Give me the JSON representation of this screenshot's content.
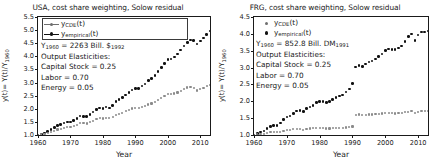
{
  "figure": {
    "panels": [
      {
        "id": "usa",
        "title": "USA, cost share weighting, Solow residual",
        "xlabel": "Year",
        "ylabel": "y(t)= Y(t)/Y",
        "ylabel_sub": "1960",
        "legend": [
          {
            "name": "y",
            "sub": "CDE",
            "suffix": "(t)",
            "color": "#8a8a8a",
            "style": "line-marker"
          },
          {
            "name": "y",
            "sub": "empirical",
            "suffix": "(t)",
            "color": "#101010",
            "style": "line-marker"
          }
        ],
        "annotations": [
          {
            "text": "Y",
            "sub": "1960",
            "rest": " = 2263 Bill. $",
            "sub2": "1992"
          },
          {
            "text": "Output Elasticities:"
          },
          {
            "text": "Capital Stock = 0.25"
          },
          {
            "text": "Labor = 0.70"
          },
          {
            "text": "Energy = 0.05"
          }
        ],
        "base_year_value": "2263",
        "currency": "Bill. $1992",
        "elasticities": {
          "capital_stock": "0.25",
          "labor": "0.70",
          "energy": "0.05"
        }
      },
      {
        "id": "frg",
        "title": "FRG, cost share weighting, Solow residual",
        "xlabel": "Year",
        "ylabel": "y(t)= Y(t)/Y",
        "ylabel_sub": "1960",
        "legend": [
          {
            "name": "y",
            "sub": "CDE",
            "suffix": "(t)",
            "color": "#8a8a8a",
            "style": "marker"
          },
          {
            "name": "y",
            "sub": "empirical",
            "suffix": "(t)",
            "color": "#101010",
            "style": "marker"
          }
        ],
        "annotations": [
          {
            "text": "Y",
            "sub": "1960",
            "rest": " = 852.8 Bill. DM",
            "sub2": "1991"
          },
          {
            "text": "Output Elasticities:"
          },
          {
            "text": "Capital Stock = 0.25"
          },
          {
            "text": "Labor = 0.70"
          },
          {
            "text": "Energy = 0.05"
          }
        ],
        "base_year_value": "852.8",
        "currency": "Bill. DM1991",
        "elasticities": {
          "capital_stock": "0.25",
          "labor": "0.70",
          "energy": "0.05"
        }
      }
    ]
  },
  "chart_data": [
    {
      "type": "scatter",
      "panel": "usa",
      "title": "USA, cost share weighting, Solow residual",
      "xlabel": "Year",
      "ylabel": "y(t)= Y(t)/Y_1960",
      "xlim": [
        1960,
        2013
      ],
      "ylim": [
        1.0,
        5.5
      ],
      "xticks": [
        1960,
        1970,
        1980,
        1990,
        2000,
        2010
      ],
      "yticks": [
        1.0,
        1.5,
        2.0,
        2.5,
        3.0,
        3.5,
        4.0,
        4.5,
        5.0,
        5.5
      ],
      "grid": false,
      "legend_position": "upper-left",
      "x": [
        1960,
        1961,
        1962,
        1963,
        1964,
        1965,
        1966,
        1967,
        1968,
        1969,
        1970,
        1971,
        1972,
        1973,
        1974,
        1975,
        1976,
        1977,
        1978,
        1979,
        1980,
        1981,
        1982,
        1983,
        1984,
        1985,
        1986,
        1987,
        1988,
        1989,
        1990,
        1991,
        1992,
        1993,
        1994,
        1995,
        1996,
        1997,
        1998,
        1999,
        2000,
        2001,
        2002,
        2003,
        2004,
        2005,
        2006,
        2007,
        2008,
        2009,
        2010,
        2011,
        2012,
        2013
      ],
      "series": [
        {
          "name": "y_empirical(t)",
          "color": "#101010",
          "values": [
            1.0,
            1.02,
            1.08,
            1.13,
            1.2,
            1.28,
            1.36,
            1.39,
            1.46,
            1.5,
            1.5,
            1.55,
            1.63,
            1.72,
            1.71,
            1.7,
            1.79,
            1.87,
            1.97,
            2.03,
            2.02,
            2.07,
            2.03,
            2.12,
            2.27,
            2.36,
            2.44,
            2.52,
            2.63,
            2.72,
            2.77,
            2.77,
            2.87,
            2.95,
            3.07,
            3.15,
            3.27,
            3.42,
            3.57,
            3.73,
            3.87,
            3.9,
            3.97,
            4.09,
            4.24,
            4.39,
            4.52,
            4.62,
            4.6,
            4.47,
            4.59,
            4.7,
            4.83,
            4.97
          ]
        },
        {
          "name": "y_CDE(t)",
          "color": "#8a8a8a",
          "values": [
            1.0,
            1.02,
            1.05,
            1.08,
            1.12,
            1.16,
            1.21,
            1.23,
            1.27,
            1.31,
            1.32,
            1.34,
            1.39,
            1.45,
            1.45,
            1.44,
            1.49,
            1.54,
            1.6,
            1.64,
            1.63,
            1.66,
            1.64,
            1.68,
            1.76,
            1.81,
            1.85,
            1.9,
            1.96,
            2.01,
            2.03,
            2.02,
            2.06,
            2.1,
            2.16,
            2.2,
            2.26,
            2.33,
            2.4,
            2.48,
            2.55,
            2.56,
            2.58,
            2.62,
            2.69,
            2.76,
            2.81,
            2.84,
            2.79,
            2.7,
            2.75,
            2.8,
            2.86,
            2.92
          ]
        }
      ]
    },
    {
      "type": "scatter",
      "panel": "frg",
      "title": "FRG, cost share weighting, Solow residual",
      "xlabel": "Year",
      "ylabel": "y(t)= Y(t)/Y_1960",
      "xlim": [
        1960,
        2013
      ],
      "ylim": [
        1.0,
        4.5
      ],
      "xticks": [
        1960,
        1970,
        1980,
        1990,
        2000,
        2010
      ],
      "yticks": [
        1.0,
        1.5,
        2.0,
        2.5,
        3.0,
        3.5,
        4.0,
        4.5
      ],
      "grid": false,
      "legend_position": "upper-left",
      "note": "Discontinuity at 1990 due to German reunification",
      "x": [
        1960,
        1961,
        1962,
        1963,
        1964,
        1965,
        1966,
        1967,
        1968,
        1969,
        1970,
        1971,
        1972,
        1973,
        1974,
        1975,
        1976,
        1977,
        1978,
        1979,
        1980,
        1981,
        1982,
        1983,
        1984,
        1985,
        1986,
        1987,
        1988,
        1989,
        1990,
        1991,
        1992,
        1993,
        1994,
        1995,
        1996,
        1997,
        1998,
        1999,
        2000,
        2001,
        2002,
        2003,
        2004,
        2005,
        2006,
        2007,
        2008,
        2009,
        2010,
        2011,
        2012,
        2013
      ],
      "series": [
        {
          "name": "y_empirical(t)",
          "color": "#101010",
          "values": [
            1.0,
            1.05,
            1.09,
            1.12,
            1.2,
            1.26,
            1.29,
            1.28,
            1.36,
            1.46,
            1.53,
            1.56,
            1.63,
            1.71,
            1.72,
            1.69,
            1.78,
            1.83,
            1.88,
            1.96,
            1.99,
            1.99,
            1.97,
            2.0,
            2.06,
            2.11,
            2.16,
            2.19,
            2.27,
            2.36,
            2.53,
            3.02,
            3.07,
            3.03,
            3.11,
            3.17,
            3.2,
            3.26,
            3.33,
            3.4,
            3.5,
            3.55,
            3.54,
            3.53,
            3.58,
            3.64,
            3.77,
            3.92,
            4.0,
            3.81,
            3.97,
            4.05,
            4.06,
            4.08
          ]
        },
        {
          "name": "y_CDE(t)",
          "color": "#8a8a8a",
          "values": [
            1.0,
            1.02,
            1.03,
            1.04,
            1.06,
            1.08,
            1.09,
            1.08,
            1.1,
            1.13,
            1.15,
            1.15,
            1.17,
            1.18,
            1.18,
            1.16,
            1.18,
            1.19,
            1.2,
            1.21,
            1.21,
            1.2,
            1.19,
            1.19,
            1.2,
            1.2,
            1.21,
            1.21,
            1.22,
            1.23,
            1.25,
            1.6,
            1.61,
            1.59,
            1.6,
            1.61,
            1.61,
            1.62,
            1.63,
            1.64,
            1.66,
            1.66,
            1.65,
            1.64,
            1.65,
            1.65,
            1.67,
            1.69,
            1.7,
            1.65,
            1.68,
            1.7,
            1.7,
            1.71
          ]
        }
      ]
    }
  ]
}
